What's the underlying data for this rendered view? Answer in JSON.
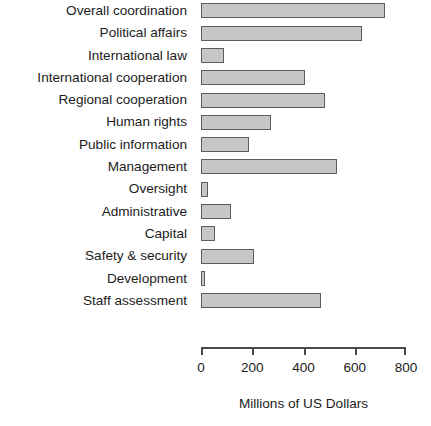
{
  "chart_data": {
    "type": "bar",
    "orientation": "horizontal",
    "title": "",
    "subtitle": "",
    "xlabel": "Millions of US Dollars",
    "ylabel": "",
    "xlim": [
      0,
      800
    ],
    "xticks": [
      0,
      200,
      400,
      600,
      800
    ],
    "xtick_labels": [
      "0",
      "200",
      "400",
      "600",
      "800"
    ],
    "grid": false,
    "legend": null,
    "bar_fill_color": "#c6c6c6",
    "bar_edge_color": "#5b5b5b",
    "background_color": "#ffffff",
    "categories": [
      "Overall coordination",
      "Political affairs",
      "International law",
      "International cooperation",
      "Regional cooperation",
      "Human rights",
      "Public information",
      "Management",
      "Oversight",
      "Administrative",
      "Capital",
      "Safety & security",
      "Development",
      "Staff assessment"
    ],
    "values": [
      718,
      630,
      88,
      406,
      484,
      272,
      188,
      532,
      29,
      116,
      55,
      208,
      16,
      468
    ]
  }
}
